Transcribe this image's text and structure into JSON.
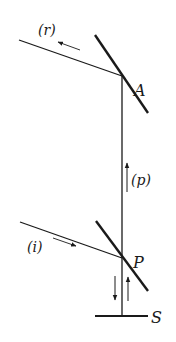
{
  "diagram": {
    "type": "optics-ray-diagram",
    "colors": {
      "ink": "#1a1a1a",
      "background": "#ffffff"
    },
    "labels": {
      "reflected": "(r)",
      "incident": "(i)",
      "propagating": "(p)",
      "mirror_top": "A",
      "mirror_bottom": "P",
      "surface": "S"
    },
    "nodes": [
      {
        "id": "A",
        "x": 122,
        "y": 76
      },
      {
        "id": "P",
        "x": 122,
        "y": 258
      },
      {
        "id": "S",
        "x": 122,
        "y": 316
      }
    ],
    "edges": [
      {
        "from": "incident-source",
        "to": "P",
        "label": "(i)",
        "direction": "toward P"
      },
      {
        "from": "P",
        "to": "A",
        "label": "(p)",
        "direction": "upward"
      },
      {
        "from": "A",
        "to": "reflected-exit",
        "label": "(r)",
        "direction": "away from A, up-left"
      },
      {
        "from": "P",
        "to": "S",
        "label": "",
        "direction": "down and back up"
      }
    ]
  }
}
